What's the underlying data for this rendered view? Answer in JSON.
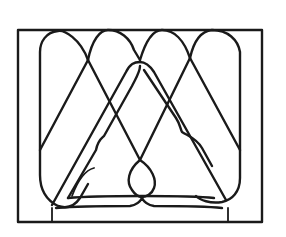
{
  "figure": {
    "colors": {
      "background": "#ffffff",
      "line": "#1a1a1a"
    }
  }
}
